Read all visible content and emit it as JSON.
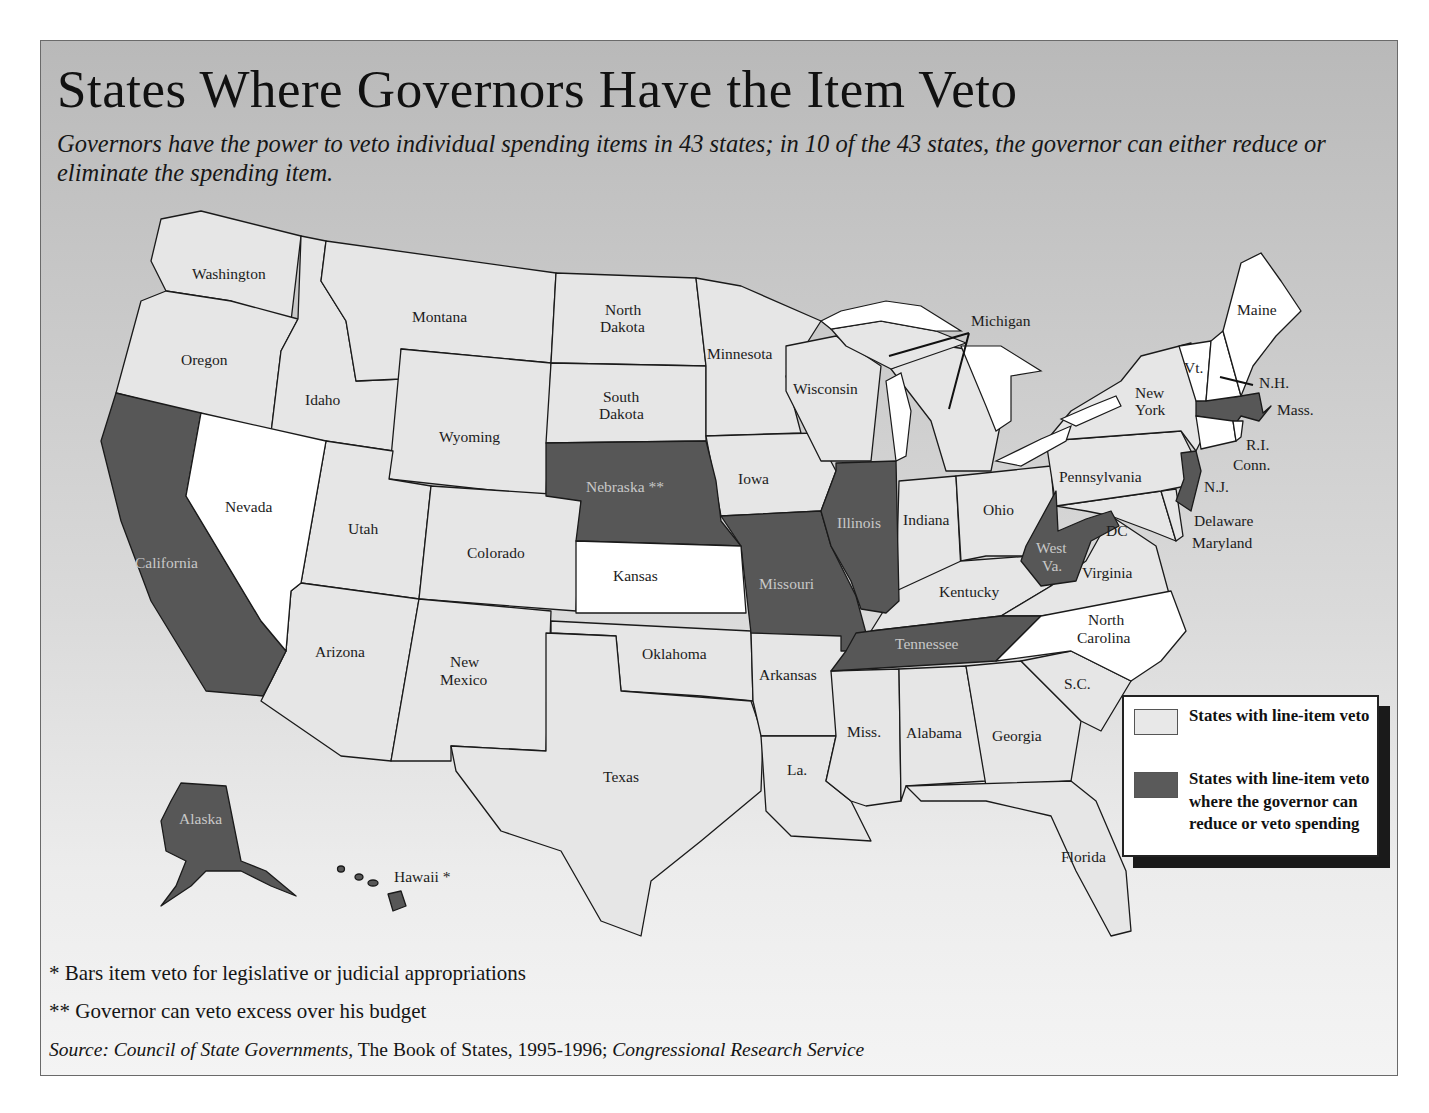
{
  "header": {
    "title": "States Where Governors Have the Item Veto",
    "subtitle": "Governors have the power to veto individual spending items in 43 states; in 10 of the 43 states, the governor can either reduce or eliminate the spending item."
  },
  "legend": {
    "items": [
      {
        "label": "States with line-item veto",
        "color": "#e8e8e8"
      },
      {
        "label": "States with line-item veto where the governor can reduce or veto spending",
        "color": "#5a5a5a"
      }
    ]
  },
  "colors": {
    "line_item_veto": "#e6e6e6",
    "reduce_or_veto": "#575757",
    "no_item_veto": "#ffffff",
    "lakes": "#ffffff",
    "background_top": "#b9b9b9",
    "background_bottom": "#f4f4f4"
  },
  "map": {
    "labels": {
      "washington": "Washington",
      "oregon": "Oregon",
      "california": "California",
      "nevada": "Nevada",
      "idaho": "Idaho",
      "montana": "Montana",
      "wyoming": "Wyoming",
      "utah": "Utah",
      "colorado": "Colorado",
      "arizona": "Arizona",
      "new_mexico_1": "New",
      "new_mexico_2": "Mexico",
      "north_dakota_1": "North",
      "north_dakota_2": "Dakota",
      "south_dakota_1": "South",
      "south_dakota_2": "Dakota",
      "nebraska": "Nebraska **",
      "kansas": "Kansas",
      "oklahoma": "Oklahoma",
      "texas": "Texas",
      "minnesota": "Minnesota",
      "iowa": "Iowa",
      "missouri": "Missouri",
      "arkansas": "Arkansas",
      "louisiana": "La.",
      "wisconsin": "Wisconsin",
      "illinois": "Illinois",
      "michigan": "Michigan",
      "indiana": "Indiana",
      "ohio": "Ohio",
      "kentucky": "Kentucky",
      "tennessee": "Tennessee",
      "mississippi": "Miss.",
      "alabama": "Alabama",
      "georgia": "Georgia",
      "florida": "Florida",
      "south_carolina": "S.C.",
      "north_carolina_1": "North",
      "north_carolina_2": "Carolina",
      "virginia": "Virginia",
      "west_virginia_1": "West",
      "west_virginia_2": "Va.",
      "dc": "DC",
      "maryland": "Maryland",
      "delaware": "Delaware",
      "pennsylvania": "Pennsylvania",
      "new_jersey": "N.J.",
      "new_york_1": "New",
      "new_york_2": "York",
      "connecticut": "Conn.",
      "rhode_island": "R.I.",
      "massachusetts": "Mass.",
      "vermont": "Vt.",
      "new_hampshire": "N.H.",
      "maine": "Maine",
      "alaska": "Alaska",
      "hawaii": "Hawaii *"
    },
    "states": {
      "line_item_veto": [
        "Washington",
        "Oregon",
        "Idaho",
        "Montana",
        "Wyoming",
        "Utah",
        "Colorado",
        "Arizona",
        "New Mexico",
        "North Dakota",
        "South Dakota",
        "Oklahoma",
        "Texas",
        "Minnesota",
        "Iowa",
        "Arkansas",
        "Louisiana",
        "Wisconsin",
        "Michigan",
        "Indiana",
        "Ohio",
        "Kentucky",
        "Mississippi",
        "Alabama",
        "Georgia",
        "Florida",
        "South Carolina",
        "Virginia",
        "Maryland",
        "Delaware",
        "Pennsylvania",
        "New York"
      ],
      "reduce_or_veto": [
        "California",
        "Nebraska",
        "Missouri",
        "Illinois",
        "Tennessee",
        "West Virginia",
        "New Jersey",
        "Massachusetts",
        "Alaska",
        "Hawaii"
      ],
      "no_item_veto": [
        "Nevada",
        "Kansas",
        "North Carolina",
        "Vermont",
        "New Hampshire",
        "Maine",
        "Rhode Island",
        "Connecticut"
      ]
    }
  },
  "footnotes": {
    "single_star": "* Bars item veto for legislative or judicial appropriations",
    "double_star": "** Governor can veto excess over his budget",
    "source_prefix": "Source: Council of State Governments,",
    "source_book": " The Book of States, 1995-1996; ",
    "source_suffix": "Congressional Research Service"
  }
}
